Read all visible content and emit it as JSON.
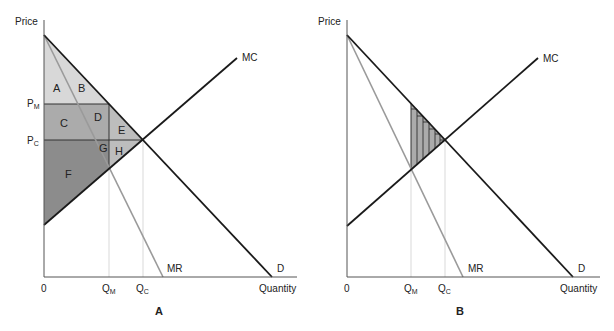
{
  "panels": [
    {
      "id": "A",
      "panel_label": "A",
      "y_axis_label": "Price",
      "x_axis_label": "Quantity",
      "origin_label": "0",
      "price_labels": {
        "pm": "P",
        "pm_sub": "M",
        "pc": "P",
        "pc_sub": "C"
      },
      "quantity_labels": {
        "qm": "Q",
        "qm_sub": "M",
        "qc": "Q",
        "qc_sub": "C"
      },
      "curve_labels": {
        "mc": "MC",
        "mr": "MR",
        "d": "D"
      },
      "regions": [
        "A",
        "B",
        "C",
        "D",
        "E",
        "F",
        "G",
        "H"
      ]
    },
    {
      "id": "B",
      "panel_label": "B",
      "y_axis_label": "Price",
      "x_axis_label": "Quantity",
      "origin_label": "0",
      "quantity_labels": {
        "qm": "Q",
        "qm_sub": "M",
        "qc": "Q",
        "qc_sub": "C"
      },
      "curve_labels": {
        "mc": "MC",
        "mr": "MR",
        "d": "D"
      },
      "shaded_area": "deadweight loss (hatched)"
    }
  ],
  "colors": {
    "light_fill": "#d8d8d8",
    "medium_fill": "#ababab",
    "dark_fill": "#8c8c8c",
    "curve": "#1a1a1a",
    "mr_curve": "#9a9a9a",
    "guide": "#cfcfcf"
  }
}
